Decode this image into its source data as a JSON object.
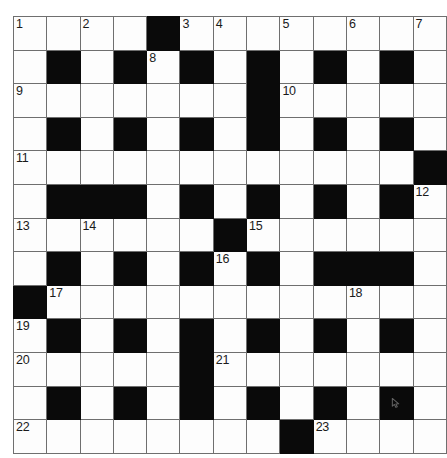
{
  "puzzle": {
    "type": "crossword-grid",
    "rows": 13,
    "columns": 13,
    "colors": {
      "block": "#0a0a0a",
      "cell": "#fdfdfd",
      "grid_line": "#6f6f6f",
      "border": "#3a3a3a",
      "number_text": "#1a1a1a"
    },
    "grid": [
      [
        {
          "block": false,
          "number": "1"
        },
        {
          "block": false,
          "number": ""
        },
        {
          "block": false,
          "number": "2"
        },
        {
          "block": false,
          "number": ""
        },
        {
          "block": true,
          "number": ""
        },
        {
          "block": false,
          "number": "3"
        },
        {
          "block": false,
          "number": "4"
        },
        {
          "block": false,
          "number": ""
        },
        {
          "block": false,
          "number": "5"
        },
        {
          "block": false,
          "number": ""
        },
        {
          "block": false,
          "number": "6"
        },
        {
          "block": false,
          "number": ""
        },
        {
          "block": false,
          "number": "7"
        }
      ],
      [
        {
          "block": false,
          "number": ""
        },
        {
          "block": true,
          "number": ""
        },
        {
          "block": false,
          "number": ""
        },
        {
          "block": true,
          "number": ""
        },
        {
          "block": false,
          "number": "8"
        },
        {
          "block": true,
          "number": ""
        },
        {
          "block": false,
          "number": ""
        },
        {
          "block": true,
          "number": ""
        },
        {
          "block": false,
          "number": ""
        },
        {
          "block": true,
          "number": ""
        },
        {
          "block": false,
          "number": ""
        },
        {
          "block": true,
          "number": ""
        },
        {
          "block": false,
          "number": ""
        }
      ],
      [
        {
          "block": false,
          "number": "9"
        },
        {
          "block": false,
          "number": ""
        },
        {
          "block": false,
          "number": ""
        },
        {
          "block": false,
          "number": ""
        },
        {
          "block": false,
          "number": ""
        },
        {
          "block": false,
          "number": ""
        },
        {
          "block": false,
          "number": ""
        },
        {
          "block": true,
          "number": ""
        },
        {
          "block": false,
          "number": "10"
        },
        {
          "block": false,
          "number": ""
        },
        {
          "block": false,
          "number": ""
        },
        {
          "block": false,
          "number": ""
        },
        {
          "block": false,
          "number": ""
        }
      ],
      [
        {
          "block": false,
          "number": ""
        },
        {
          "block": true,
          "number": ""
        },
        {
          "block": false,
          "number": ""
        },
        {
          "block": true,
          "number": ""
        },
        {
          "block": false,
          "number": ""
        },
        {
          "block": true,
          "number": ""
        },
        {
          "block": false,
          "number": ""
        },
        {
          "block": true,
          "number": ""
        },
        {
          "block": false,
          "number": ""
        },
        {
          "block": true,
          "number": ""
        },
        {
          "block": false,
          "number": ""
        },
        {
          "block": true,
          "number": ""
        },
        {
          "block": false,
          "number": ""
        }
      ],
      [
        {
          "block": false,
          "number": "11"
        },
        {
          "block": false,
          "number": ""
        },
        {
          "block": false,
          "number": ""
        },
        {
          "block": false,
          "number": ""
        },
        {
          "block": false,
          "number": ""
        },
        {
          "block": false,
          "number": ""
        },
        {
          "block": false,
          "number": ""
        },
        {
          "block": false,
          "number": ""
        },
        {
          "block": false,
          "number": ""
        },
        {
          "block": false,
          "number": ""
        },
        {
          "block": false,
          "number": ""
        },
        {
          "block": false,
          "number": ""
        },
        {
          "block": true,
          "number": ""
        }
      ],
      [
        {
          "block": false,
          "number": ""
        },
        {
          "block": true,
          "number": ""
        },
        {
          "block": true,
          "number": ""
        },
        {
          "block": true,
          "number": ""
        },
        {
          "block": false,
          "number": ""
        },
        {
          "block": true,
          "number": ""
        },
        {
          "block": false,
          "number": ""
        },
        {
          "block": true,
          "number": ""
        },
        {
          "block": false,
          "number": ""
        },
        {
          "block": true,
          "number": ""
        },
        {
          "block": false,
          "number": ""
        },
        {
          "block": true,
          "number": ""
        },
        {
          "block": false,
          "number": "12"
        }
      ],
      [
        {
          "block": false,
          "number": "13"
        },
        {
          "block": false,
          "number": ""
        },
        {
          "block": false,
          "number": "14"
        },
        {
          "block": false,
          "number": ""
        },
        {
          "block": false,
          "number": ""
        },
        {
          "block": false,
          "number": ""
        },
        {
          "block": true,
          "number": ""
        },
        {
          "block": false,
          "number": "15"
        },
        {
          "block": false,
          "number": ""
        },
        {
          "block": false,
          "number": ""
        },
        {
          "block": false,
          "number": ""
        },
        {
          "block": false,
          "number": ""
        },
        {
          "block": false,
          "number": ""
        }
      ],
      [
        {
          "block": false,
          "number": ""
        },
        {
          "block": true,
          "number": ""
        },
        {
          "block": false,
          "number": ""
        },
        {
          "block": true,
          "number": ""
        },
        {
          "block": false,
          "number": ""
        },
        {
          "block": true,
          "number": ""
        },
        {
          "block": false,
          "number": "16"
        },
        {
          "block": true,
          "number": ""
        },
        {
          "block": false,
          "number": ""
        },
        {
          "block": true,
          "number": ""
        },
        {
          "block": true,
          "number": ""
        },
        {
          "block": true,
          "number": ""
        },
        {
          "block": false,
          "number": ""
        }
      ],
      [
        {
          "block": true,
          "number": ""
        },
        {
          "block": false,
          "number": "17"
        },
        {
          "block": false,
          "number": ""
        },
        {
          "block": false,
          "number": ""
        },
        {
          "block": false,
          "number": ""
        },
        {
          "block": false,
          "number": ""
        },
        {
          "block": false,
          "number": ""
        },
        {
          "block": false,
          "number": ""
        },
        {
          "block": false,
          "number": ""
        },
        {
          "block": false,
          "number": ""
        },
        {
          "block": false,
          "number": "18"
        },
        {
          "block": false,
          "number": ""
        },
        {
          "block": false,
          "number": ""
        }
      ],
      [
        {
          "block": false,
          "number": "19"
        },
        {
          "block": true,
          "number": ""
        },
        {
          "block": false,
          "number": ""
        },
        {
          "block": true,
          "number": ""
        },
        {
          "block": false,
          "number": ""
        },
        {
          "block": true,
          "number": ""
        },
        {
          "block": false,
          "number": ""
        },
        {
          "block": true,
          "number": ""
        },
        {
          "block": false,
          "number": ""
        },
        {
          "block": true,
          "number": ""
        },
        {
          "block": false,
          "number": ""
        },
        {
          "block": true,
          "number": ""
        },
        {
          "block": false,
          "number": ""
        }
      ],
      [
        {
          "block": false,
          "number": "20"
        },
        {
          "block": false,
          "number": ""
        },
        {
          "block": false,
          "number": ""
        },
        {
          "block": false,
          "number": ""
        },
        {
          "block": false,
          "number": ""
        },
        {
          "block": true,
          "number": ""
        },
        {
          "block": false,
          "number": "21"
        },
        {
          "block": false,
          "number": ""
        },
        {
          "block": false,
          "number": ""
        },
        {
          "block": false,
          "number": ""
        },
        {
          "block": false,
          "number": ""
        },
        {
          "block": false,
          "number": ""
        },
        {
          "block": false,
          "number": ""
        }
      ],
      [
        {
          "block": false,
          "number": ""
        },
        {
          "block": true,
          "number": ""
        },
        {
          "block": false,
          "number": ""
        },
        {
          "block": true,
          "number": ""
        },
        {
          "block": false,
          "number": ""
        },
        {
          "block": true,
          "number": ""
        },
        {
          "block": false,
          "number": ""
        },
        {
          "block": true,
          "number": ""
        },
        {
          "block": false,
          "number": ""
        },
        {
          "block": true,
          "number": ""
        },
        {
          "block": false,
          "number": ""
        },
        {
          "block": true,
          "number": "",
          "cursor": true
        },
        {
          "block": false,
          "number": ""
        }
      ],
      [
        {
          "block": false,
          "number": "22"
        },
        {
          "block": false,
          "number": ""
        },
        {
          "block": false,
          "number": ""
        },
        {
          "block": false,
          "number": ""
        },
        {
          "block": false,
          "number": ""
        },
        {
          "block": false,
          "number": ""
        },
        {
          "block": false,
          "number": ""
        },
        {
          "block": false,
          "number": ""
        },
        {
          "block": true,
          "number": ""
        },
        {
          "block": false,
          "number": "23"
        },
        {
          "block": false,
          "number": ""
        },
        {
          "block": false,
          "number": ""
        },
        {
          "block": false,
          "number": ""
        }
      ]
    ]
  }
}
